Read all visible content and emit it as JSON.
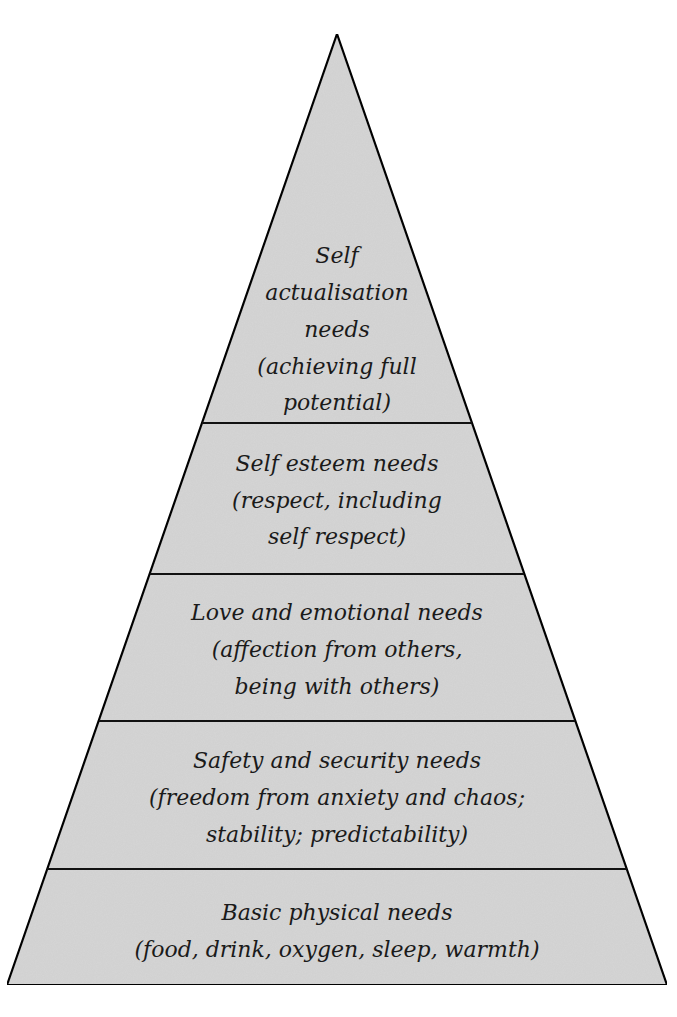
{
  "diagram": {
    "type": "pyramid",
    "colors": {
      "fill": "#d6d6d6",
      "stroke": "#111111",
      "text": "#1a1a1a",
      "background": "#ffffff"
    },
    "tiers": [
      {
        "id": "self-actualisation",
        "lines": [
          "Self",
          "actualisation",
          "needs",
          "(achieving full",
          "potential)"
        ]
      },
      {
        "id": "self-esteem",
        "lines": [
          "Self esteem needs",
          "(respect, including",
          "self respect)"
        ]
      },
      {
        "id": "love-emotional",
        "lines": [
          "Love and emotional needs",
          "(affection from others,",
          "being with others)"
        ]
      },
      {
        "id": "safety-security",
        "lines": [
          "Safety and security needs",
          "(freedom from anxiety and chaos;",
          "stability; predictability)"
        ]
      },
      {
        "id": "basic-physical",
        "lines": [
          "Basic physical needs",
          "(food, drink, oxygen, sleep, warmth)"
        ]
      }
    ]
  }
}
